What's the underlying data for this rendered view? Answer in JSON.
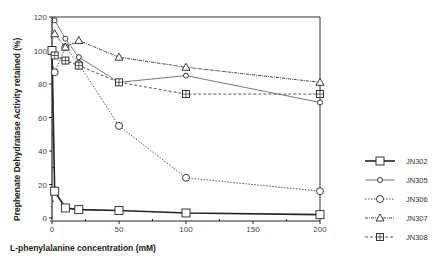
{
  "chart_data": {
    "type": "line",
    "title": "",
    "xlabel": "L-phenylalanine concentration (mM)",
    "ylabel": "Prephenate Dehydratase Activity retained (%)",
    "xlim": [
      0,
      200
    ],
    "ylim": [
      0,
      120
    ],
    "xticks": [
      0,
      50,
      100,
      150,
      200
    ],
    "yticks": [
      0,
      20,
      40,
      60,
      80,
      100,
      120
    ],
    "grid": false,
    "legend_position": "right",
    "series": [
      {
        "name": "JN302",
        "marker": "square",
        "line": "solid-thick",
        "x": [
          0,
          2,
          10,
          20,
          50,
          100,
          200
        ],
        "values": [
          100,
          16,
          6,
          5,
          4.5,
          3,
          2
        ]
      },
      {
        "name": "JN305",
        "marker": "diamond",
        "line": "solid-thin",
        "x": [
          2,
          10,
          20,
          50,
          100,
          200
        ],
        "values": [
          118,
          107,
          96,
          81,
          85,
          69
        ]
      },
      {
        "name": "JN306",
        "marker": "circle",
        "line": "dotted",
        "x": [
          2,
          10,
          20,
          50,
          100,
          200
        ],
        "values": [
          87,
          102,
          92,
          55,
          24,
          16
        ]
      },
      {
        "name": "JN307",
        "marker": "triangle",
        "line": "dash-dot",
        "x": [
          2,
          10,
          20,
          50,
          100,
          200
        ],
        "values": [
          110,
          102,
          106,
          96,
          90,
          81
        ]
      },
      {
        "name": "JN308",
        "marker": "boxed-plus",
        "line": "dashed",
        "x": [
          2,
          10,
          20,
          50,
          100,
          200
        ],
        "values": [
          97,
          94,
          91,
          81,
          74,
          74
        ]
      }
    ]
  }
}
